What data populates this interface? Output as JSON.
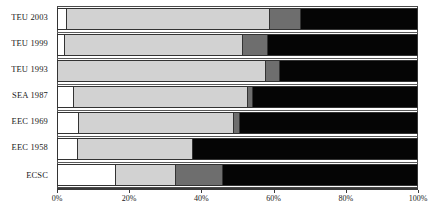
{
  "chart_data": {
    "type": "bar",
    "orientation": "horizontal",
    "stacked": true,
    "normalized": "100%",
    "title": "",
    "subtitle": "",
    "xlabel": "",
    "ylabel": "",
    "grid": false,
    "legend": "none",
    "xlim": [
      0,
      100
    ],
    "xticks": [
      0,
      20,
      40,
      60,
      80,
      100
    ],
    "xticklabels": [
      "0%",
      "20%",
      "40%",
      "60%",
      "80%",
      "100%"
    ],
    "categories": [
      "TEU 2003",
      "TEU 1999",
      "TEU 1993",
      "SEA 1987",
      "EEC 1969",
      "EEC 1958",
      "ECSC"
    ],
    "series": [
      {
        "name": "segment-1",
        "color": "#ffffff",
        "values": [
          2.6,
          2.0,
          0.0,
          4.4,
          5.8,
          5.5,
          16.2
        ]
      },
      {
        "name": "segment-2",
        "color": "#d2d2d2",
        "values": [
          56.0,
          49.2,
          57.7,
          48.2,
          42.9,
          31.9,
          16.5
        ]
      },
      {
        "name": "segment-3",
        "color": "#6e6e6e",
        "values": [
          8.8,
          7.0,
          3.7,
          1.4,
          1.6,
          0.0,
          13.0
        ]
      },
      {
        "name": "segment-4",
        "color": "#050505",
        "values": [
          32.6,
          41.8,
          38.6,
          46.0,
          49.7,
          62.6,
          54.3
        ]
      }
    ],
    "cumulative_boundaries": {
      "TEU 2003": [
        2.6,
        58.6,
        67.4,
        100
      ],
      "TEU 1999": [
        2.0,
        51.2,
        58.2,
        100
      ],
      "TEU 1993": [
        0.0,
        57.7,
        61.4,
        100
      ],
      "SEA 1987": [
        4.4,
        52.6,
        54.0,
        100
      ],
      "EEC 1969": [
        5.8,
        48.7,
        50.3,
        100
      ],
      "EEC 1958": [
        5.5,
        37.4,
        37.4,
        100
      ],
      "ECSC": [
        16.2,
        32.7,
        45.7,
        100
      ]
    }
  },
  "axis": {
    "x_tick_labels": [
      "0%",
      "20%",
      "40%",
      "60%",
      "80%",
      "100%"
    ]
  },
  "categories": {
    "labels": [
      "TEU 2003",
      "TEU 1999",
      "TEU 1993",
      "SEA 1987",
      "EEC 1969",
      "EEC 1958",
      "ECSC"
    ]
  },
  "colors": {
    "segment_1": "#ffffff",
    "segment_2": "#d2d2d2",
    "segment_3": "#6e6e6e",
    "segment_4": "#050505",
    "outline": "#333333",
    "text": "#1a1a1a"
  }
}
